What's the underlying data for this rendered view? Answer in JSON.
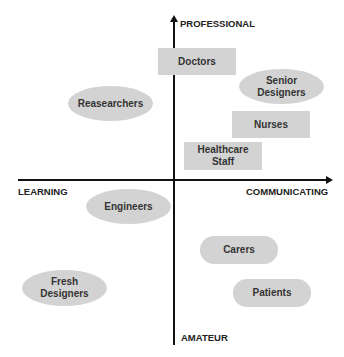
{
  "axes": {
    "top": "PROFESSIONAL",
    "bottom": "AMATEUR",
    "left": "LEARNING",
    "right": "COMMUNICATING"
  },
  "nodes": [
    {
      "label": "Doctors",
      "shape": "rect"
    },
    {
      "label": "Senior\nDesigners",
      "shape": "ellipse"
    },
    {
      "label": "Reasearchers",
      "shape": "ellipse"
    },
    {
      "label": "Nurses",
      "shape": "rect"
    },
    {
      "label": "Healthcare\nStaff",
      "shape": "rect"
    },
    {
      "label": "Engineers",
      "shape": "ellipse"
    },
    {
      "label": "Carers",
      "shape": "pill"
    },
    {
      "label": "Fresh\nDesigners",
      "shape": "ellipse"
    },
    {
      "label": "Patients",
      "shape": "pill"
    }
  ],
  "colors": {
    "node_fill": "#d3d3d3",
    "axis": "#111111",
    "text": "#333333"
  }
}
